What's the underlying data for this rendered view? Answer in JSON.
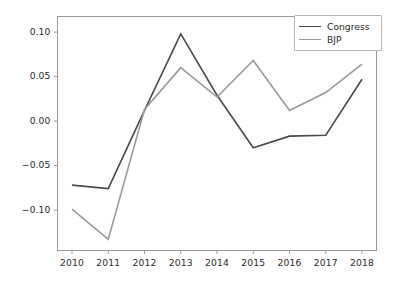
{
  "chart_data": {
    "type": "line",
    "title": "",
    "xlabel": "",
    "ylabel": "",
    "x": [
      2010,
      2011,
      2012,
      2013,
      2014,
      2015,
      2016,
      2017,
      2018
    ],
    "xticklabels": [
      "2010",
      "2011",
      "2012",
      "2013",
      "2014",
      "2015",
      "2016",
      "2017",
      "2018"
    ],
    "yticks": [
      -0.1,
      -0.05,
      0.0,
      0.05,
      0.1
    ],
    "yticklabels": [
      "−0.10",
      "−0.05",
      "0.00",
      "0.05",
      "0.10"
    ],
    "xlim": [
      2009.6,
      2018.4
    ],
    "ylim": [
      -0.1455,
      0.1175
    ],
    "grid": false,
    "legend_position": "upper right",
    "series": [
      {
        "name": "Congress",
        "color": "#4a4a4a",
        "values": [
          -0.072,
          -0.076,
          0.012,
          0.098,
          0.029,
          -0.03,
          -0.017,
          -0.016,
          0.047
        ]
      },
      {
        "name": "BJP",
        "color": "#9a9a9a",
        "values": [
          -0.099,
          -0.133,
          0.013,
          0.06,
          0.027,
          0.068,
          0.012,
          0.032,
          0.064
        ]
      }
    ]
  },
  "axes": {
    "spine_color": "#999999",
    "tick_color": "#999999",
    "label_color": "#2b2b2b",
    "background": "#ffffff"
  }
}
